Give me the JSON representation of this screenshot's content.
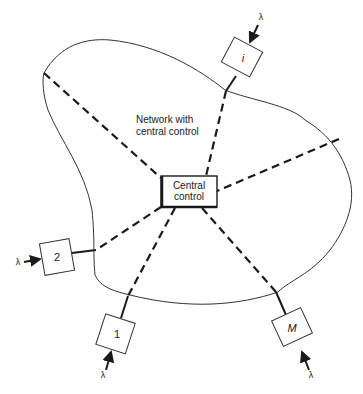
{
  "diagram": {
    "network_label_line1": "Network with",
    "network_label_line2": "central control",
    "central_line1": "Central",
    "central_line2": "control",
    "nodes": [
      {
        "id": "i",
        "label": "i",
        "input": "λ"
      },
      {
        "id": "2",
        "label": "2",
        "input": "λ"
      },
      {
        "id": "1",
        "label": "1",
        "input": "λ"
      },
      {
        "id": "M",
        "label": "M",
        "input": "λ"
      }
    ],
    "colors": {
      "line": "#1a1a1a",
      "background": "#ffffff"
    }
  }
}
